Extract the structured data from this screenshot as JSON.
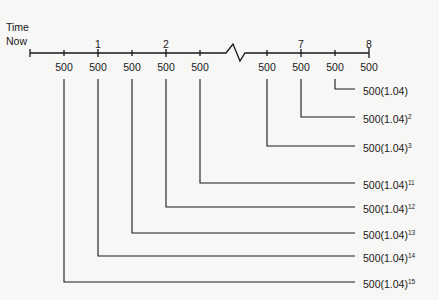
{
  "axis": {
    "start_label_line1": "Time",
    "start_label_line2": "Now",
    "period_labels": [
      {
        "text": "1",
        "x": 98
      },
      {
        "text": "2",
        "x": 166
      },
      {
        "text": "7",
        "x": 301
      },
      {
        "text": "8",
        "x": 369
      }
    ],
    "payments": [
      {
        "text": "500",
        "x": 64
      },
      {
        "text": "500",
        "x": 98
      },
      {
        "text": "500",
        "x": 132
      },
      {
        "text": "500",
        "x": 166
      },
      {
        "text": "500",
        "x": 200
      },
      {
        "text": "500",
        "x": 267
      },
      {
        "text": "500",
        "x": 301
      },
      {
        "text": "500",
        "x": 335
      },
      {
        "text": "500",
        "x": 369
      }
    ]
  },
  "future_values": [
    {
      "base": "500(1.04)",
      "exp": "",
      "from_x": 335,
      "y": 89
    },
    {
      "base": "500(1.04)",
      "exp": "2",
      "from_x": 301,
      "y": 117
    },
    {
      "base": "500(1.04)",
      "exp": "3",
      "from_x": 267,
      "y": 146
    },
    {
      "base": "500(1.04)",
      "exp": "11",
      "from_x": 200,
      "y": 183
    },
    {
      "base": "500(1.04)",
      "exp": "12",
      "from_x": 166,
      "y": 207
    },
    {
      "base": "500(1.04)",
      "exp": "13",
      "from_x": 132,
      "y": 233
    },
    {
      "base": "500(1.04)",
      "exp": "14",
      "from_x": 98,
      "y": 256
    },
    {
      "base": "500(1.04)",
      "exp": "15",
      "from_x": 64,
      "y": 282
    }
  ]
}
